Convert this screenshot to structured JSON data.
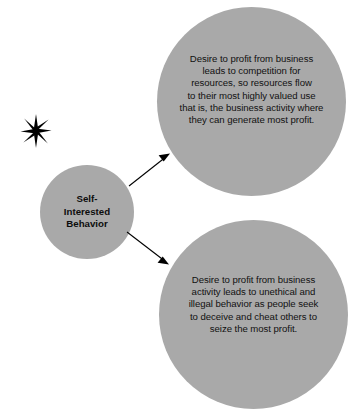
{
  "canvas": {
    "width": 351,
    "height": 419,
    "background_color": "#ffffff"
  },
  "style": {
    "circle_fill": "#a9a9a9",
    "text_color": "#111111",
    "arrow_color": "#000000",
    "star_color": "#000000"
  },
  "diagram": {
    "type": "concept-map",
    "source_node": {
      "name": "self-interested-behavior",
      "lines": [
        "Self-",
        "Interested",
        "Behavior"
      ],
      "bold": true
    },
    "outcome_nodes": [
      {
        "name": "positive-outcome",
        "lines": [
          "Desire to profit from business",
          "leads to competition for",
          "resources, so resources flow",
          "to their most highly valued use",
          "that is, the business activity where",
          "they can generate most profit."
        ]
      },
      {
        "name": "negative-outcome",
        "lines": [
          "Desire to profit from business",
          "activity leads to unethical and",
          "illegal behavior as people seek",
          "to deceive and cheat others to",
          "seize the most profit."
        ]
      }
    ],
    "connectors": [
      {
        "name": "arrow-to-positive-outcome",
        "from": "self-interested-behavior",
        "to": "positive-outcome",
        "direction": "up-right"
      },
      {
        "name": "arrow-to-negative-outcome",
        "from": "self-interested-behavior",
        "to": "negative-outcome",
        "direction": "down-right"
      }
    ],
    "decorations": [
      {
        "name": "asterisk-star-mark",
        "glyph": "eight-pointed-star"
      }
    ]
  }
}
